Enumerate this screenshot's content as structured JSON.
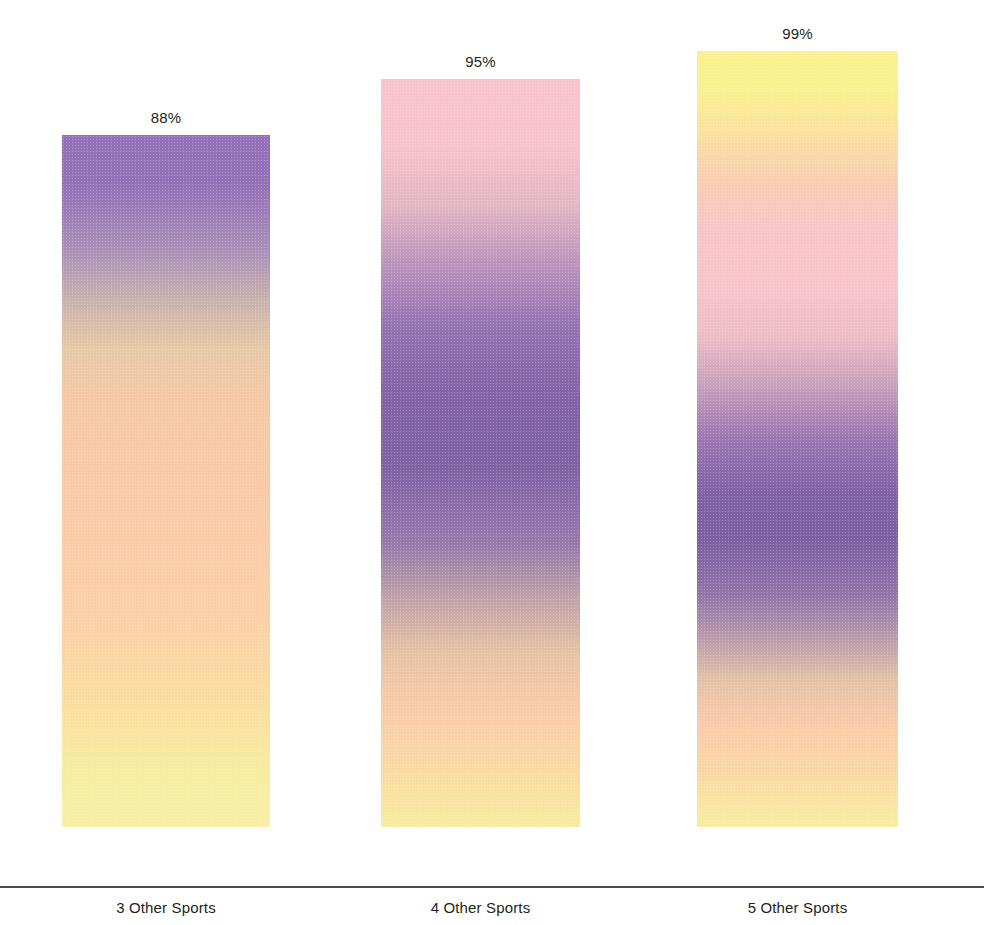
{
  "chart_data": {
    "type": "bar",
    "title": "",
    "subtitle": "",
    "xlabel": "",
    "ylabel": "",
    "categories": [
      "3 Other Sports",
      "4 Other Sports",
      "5 Other Sports"
    ],
    "values": [
      88,
      95,
      99
    ],
    "value_labels": [
      "88%",
      "95%",
      "99%"
    ],
    "ylim": [
      0,
      100
    ],
    "grid": false,
    "legend": false,
    "legend_position": "none",
    "background": "#ffffff",
    "text_color": "#231f20",
    "axis_color": "#4a4a4a",
    "gradient_palette": {
      "purple": "#8a68ae",
      "deep_purple": "#7b5ba0",
      "pink": "#f8c3cd",
      "peach": "#fac7a8",
      "pale_yellow": "#faf0a8",
      "yellow": "#fbf28f"
    },
    "bars": [
      {
        "category": "3 Other Sports",
        "value": 88,
        "label": "88%",
        "x": 62,
        "width": 208,
        "top": 174,
        "height": 692,
        "gradient": "linear-gradient(to bottom, #9470b8 0%, #9470b8 7%, #a98cb9 16%, #c9b2ae 24%, #e6c9a6 31%, #f6c8a6 39%, #fbcaa8 55%, #fbd0a6 70%, #faddA0 82%, #f7ec9f 92%, #f6f0a4 100%)"
      },
      {
        "category": "4 Other Sports",
        "value": 95,
        "label": "95%",
        "x": 381,
        "width": 199,
        "top": 118,
        "height": 748,
        "gradient": "linear-gradient(to bottom, #f9c2cc 0%, #f8c2cb 9%, #e2b6c4 17%, #b992bd 25%, #9772b2 33%, #8361a8 43%, #8161a6 52%, #9878ac 62%, #c3a5a8 70%, #e7c3a4 77%, #f9cba8 84%, #fad7a4 91%, #f7eb9f 100%)"
      },
      {
        "category": "5 Other Sports",
        "value": 99,
        "label": "99%",
        "x": 697,
        "width": 201,
        "top": 90,
        "height": 776,
        "gradient": "linear-gradient(to bottom, #faf08e 0%, #faf08e 5%, #fadfa0 11%, #f9cdb2 17%, #f8c5c6 23%, #f8c3cb 31%, #ecbcc4 37%, #c8a0bb 43%, #9b76b2 50%, #8160a6 57%, #7e5ea3 63%, #9373a9 70%, #bd9dab 76%, #e4c1a6 81%, #fbcba8 87%, #fad8a4 93%, #f8edA0 100%)"
      }
    ]
  }
}
